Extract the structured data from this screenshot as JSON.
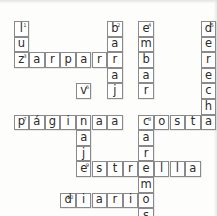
{
  "puzzle": {
    "type": "crossword",
    "title": "Crucigrama",
    "language": "es",
    "grid": {
      "cols": 14,
      "rows": 13,
      "cell_size": 15.6,
      "origin_x": 13.5,
      "origin_y": 21.0
    },
    "colors": {
      "cell_border": "#8a8a8a",
      "cell_fill": "#ffffff",
      "ink": "#2b2b2b",
      "page": "#fdfdfc"
    },
    "entries": [
      {
        "number": "1",
        "answer": "luz",
        "direction": "down",
        "col": 0,
        "row": 0
      },
      {
        "number": "2",
        "answer": "baraja",
        "direction": "down",
        "col": 6,
        "row": 0
      },
      {
        "number": "3",
        "answer": "zarpar",
        "direction": "across",
        "col": 0,
        "row": 2
      },
      {
        "number": "4",
        "answer": "embarcaremos",
        "direction": "down",
        "col": 8,
        "row": 0
      },
      {
        "number": "5",
        "answer": "derecha",
        "direction": "down",
        "col": 12,
        "row": 0
      },
      {
        "number": "6",
        "answer": "viaje",
        "direction": "down",
        "col": 4,
        "row": 4
      },
      {
        "number": "7",
        "answer": "página",
        "direction": "across",
        "col": 0,
        "row": 6
      },
      {
        "number": "8",
        "answer": "costa",
        "direction": "across",
        "col": 8,
        "row": 6
      },
      {
        "number": "9",
        "answer": "estrella",
        "direction": "across",
        "col": 4,
        "row": 8
      },
      {
        "number": "10",
        "answer": "diario",
        "direction": "across",
        "col": 3,
        "row": 10
      }
    ],
    "cells": [
      {
        "col": 0,
        "row": 0,
        "letter": "l",
        "number": "1"
      },
      {
        "col": 6,
        "row": 0,
        "letter": "b",
        "number": "2"
      },
      {
        "col": 8,
        "row": 0,
        "letter": "e",
        "number": "4"
      },
      {
        "col": 12,
        "row": 0,
        "letter": "d",
        "number": "5"
      },
      {
        "col": 0,
        "row": 1,
        "letter": "u",
        "number": ""
      },
      {
        "col": 6,
        "row": 1,
        "letter": "a",
        "number": ""
      },
      {
        "col": 8,
        "row": 1,
        "letter": "m",
        "number": ""
      },
      {
        "col": 12,
        "row": 1,
        "letter": "e",
        "number": ""
      },
      {
        "col": 0,
        "row": 2,
        "letter": "z",
        "number": "3"
      },
      {
        "col": 1,
        "row": 2,
        "letter": "a",
        "number": ""
      },
      {
        "col": 2,
        "row": 2,
        "letter": "r",
        "number": ""
      },
      {
        "col": 3,
        "row": 2,
        "letter": "p",
        "number": ""
      },
      {
        "col": 4,
        "row": 2,
        "letter": "a",
        "number": ""
      },
      {
        "col": 5,
        "row": 2,
        "letter": "r",
        "number": ""
      },
      {
        "col": 6,
        "row": 2,
        "letter": "r",
        "number": ""
      },
      {
        "col": 8,
        "row": 2,
        "letter": "b",
        "number": ""
      },
      {
        "col": 12,
        "row": 2,
        "letter": "r",
        "number": ""
      },
      {
        "col": 6,
        "row": 3,
        "letter": "a",
        "number": ""
      },
      {
        "col": 8,
        "row": 3,
        "letter": "a",
        "number": ""
      },
      {
        "col": 12,
        "row": 3,
        "letter": "e",
        "number": ""
      },
      {
        "col": 4,
        "row": 4,
        "letter": "v",
        "number": "6"
      },
      {
        "col": 6,
        "row": 4,
        "letter": "j",
        "number": ""
      },
      {
        "col": 8,
        "row": 4,
        "letter": "r",
        "number": ""
      },
      {
        "col": 12,
        "row": 4,
        "letter": "c",
        "number": ""
      },
      {
        "col": 12,
        "row": 5,
        "letter": "h",
        "number": ""
      },
      {
        "col": 0,
        "row": 6,
        "letter": "p",
        "number": "7"
      },
      {
        "col": 1,
        "row": 6,
        "letter": "á",
        "number": ""
      },
      {
        "col": 2,
        "row": 6,
        "letter": "g",
        "number": ""
      },
      {
        "col": 3,
        "row": 6,
        "letter": "i",
        "number": ""
      },
      {
        "col": 4,
        "row": 6,
        "letter": "n",
        "number": ""
      },
      {
        "col": 5,
        "row": 6,
        "letter": "a",
        "number": ""
      },
      {
        "col": 6,
        "row": 6,
        "letter": "a",
        "number": ""
      },
      {
        "col": 8,
        "row": 6,
        "letter": "c",
        "number": "8"
      },
      {
        "col": 9,
        "row": 6,
        "letter": "o",
        "number": ""
      },
      {
        "col": 10,
        "row": 6,
        "letter": "s",
        "number": ""
      },
      {
        "col": 11,
        "row": 6,
        "letter": "t",
        "number": ""
      },
      {
        "col": 12,
        "row": 6,
        "letter": "a",
        "number": ""
      },
      {
        "col": 4,
        "row": 7,
        "letter": "a",
        "number": ""
      },
      {
        "col": 8,
        "row": 7,
        "letter": "a",
        "number": ""
      },
      {
        "col": 4,
        "row": 8,
        "letter": "j",
        "number": ""
      },
      {
        "col": 8,
        "row": 8,
        "letter": "r",
        "number": ""
      },
      {
        "col": 4,
        "row": 9,
        "letter": "e",
        "number": "9"
      },
      {
        "col": 5,
        "row": 9,
        "letter": "s",
        "number": ""
      },
      {
        "col": 6,
        "row": 9,
        "letter": "t",
        "number": ""
      },
      {
        "col": 7,
        "row": 9,
        "letter": "r",
        "number": ""
      },
      {
        "col": 8,
        "row": 9,
        "letter": "e",
        "number": ""
      },
      {
        "col": 9,
        "row": 9,
        "letter": "l",
        "number": ""
      },
      {
        "col": 10,
        "row": 9,
        "letter": "l",
        "number": ""
      },
      {
        "col": 11,
        "row": 9,
        "letter": "a",
        "number": ""
      },
      {
        "col": 8,
        "row": 10,
        "letter": "m",
        "number": ""
      },
      {
        "col": 3,
        "row": 11,
        "letter": "d",
        "number": "10"
      },
      {
        "col": 4,
        "row": 11,
        "letter": "i",
        "number": ""
      },
      {
        "col": 5,
        "row": 11,
        "letter": "a",
        "number": ""
      },
      {
        "col": 6,
        "row": 11,
        "letter": "r",
        "number": ""
      },
      {
        "col": 7,
        "row": 11,
        "letter": "i",
        "number": ""
      },
      {
        "col": 8,
        "row": 11,
        "letter": "o",
        "number": ""
      },
      {
        "col": 8,
        "row": 12,
        "letter": "s",
        "number": ""
      }
    ]
  }
}
